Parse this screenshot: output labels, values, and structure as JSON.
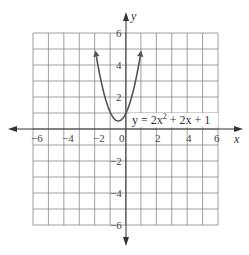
{
  "chart_data": {
    "type": "line",
    "title": "",
    "xlabel": "x",
    "ylabel": "y",
    "xlim": [
      -6,
      6
    ],
    "ylim": [
      -6,
      6
    ],
    "grid": true,
    "x_ticks": [
      "-6",
      "-4",
      "-2",
      "0",
      "2",
      "4",
      "6"
    ],
    "y_ticks": [
      "6",
      "4",
      "2",
      "-2",
      "-4",
      "-6"
    ],
    "series": [
      {
        "name": "y = 2x² + 2x + 1",
        "function": "2x^2+2x+1",
        "x": [
          -2,
          -1.5,
          -1,
          -0.5,
          0,
          0.5,
          1
        ],
        "y": [
          5,
          2.5,
          1,
          0.5,
          1,
          2.5,
          5
        ]
      }
    ],
    "annotations": [
      "y = 2x² + 2x + 1"
    ],
    "vertex": [
      -0.5,
      0.5
    ]
  },
  "labels": {
    "x_axis": "x",
    "y_axis": "y",
    "equation_prefix": "y = 2x",
    "equation_sup": "2",
    "equation_suffix": " + 2x + 1",
    "origin": "0",
    "xt": {
      "m6": "−6",
      "m4": "−4",
      "m2": "−2",
      "p2": "2",
      "p4": "4",
      "p6": "6"
    },
    "yt": {
      "p6": "6",
      "p4": "4",
      "p2": "2",
      "m2": "−2",
      "m4": "−4",
      "m6": "−6"
    }
  }
}
